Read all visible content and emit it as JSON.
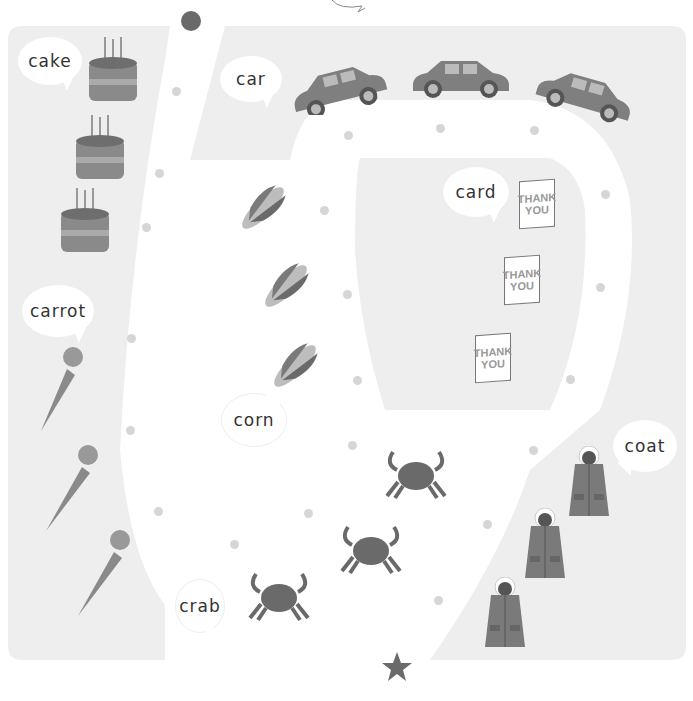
{
  "game": {
    "type": "picture maze / path tracing",
    "start_marker": "circle",
    "end_marker": "star",
    "colors": {
      "background": "#ffffff",
      "zone": "#eeeeee",
      "path": "#ffffff",
      "dot": "#d6d6d6",
      "marker": "#6a6a6a",
      "item": "#7a7a7a"
    }
  },
  "zones": [
    {
      "label": "cake",
      "count": 3
    },
    {
      "label": "car",
      "count": 3
    },
    {
      "label": "card",
      "count": 3
    },
    {
      "label": "carrot",
      "count": 3
    },
    {
      "label": "corn",
      "count": 3
    },
    {
      "label": "coat",
      "count": 3
    },
    {
      "label": "crab",
      "count": 3
    }
  ],
  "card_text": {
    "line1": "THANK",
    "line2": "YOU"
  },
  "icons": {
    "start": "start-circle-icon",
    "end": "finish-star-icon"
  }
}
